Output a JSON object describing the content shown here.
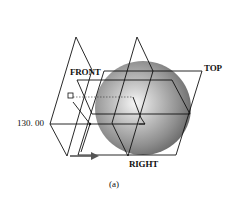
{
  "diagram": {
    "planes": [
      {
        "name": "FRONT",
        "label": "FRONT"
      },
      {
        "name": "TOP",
        "label": "TOP"
      },
      {
        "name": "RIGHT",
        "label": "RIGHT"
      }
    ],
    "dimension": {
      "value": "130. 00"
    },
    "caption": "(a)",
    "colors": {
      "line": "#111111",
      "sphere_light": "#f2f2f2",
      "sphere_mid": "#a0a0a0",
      "sphere_dark": "#5a5a5a",
      "arrow": "#555555"
    }
  }
}
